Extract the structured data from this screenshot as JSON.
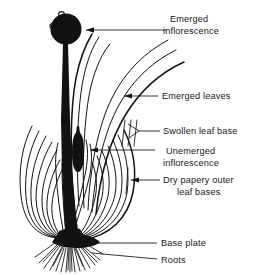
{
  "figure": {
    "background_color": "#ffffff",
    "ink_color": "#121212"
  },
  "labels": [
    {
      "id": "emerged-inflorescence",
      "line1": "Emerged",
      "line2": "inflorescence",
      "leader": "arrow",
      "points_to": "flower-head"
    },
    {
      "id": "emerged-leaves",
      "line1": "Emerged leaves",
      "line2": "",
      "leader": "arrow",
      "points_to": "outer-emerged-leaf"
    },
    {
      "id": "swollen-leaf-base",
      "line1": "Swollen leaf base",
      "line2": "",
      "leader": "fork",
      "points_to": "inner-fleshy-scales"
    },
    {
      "id": "unemerged-inflorescence",
      "line1": "Unemerged",
      "line2": "inflorescence",
      "leader": "arrow",
      "points_to": "inner-bud"
    },
    {
      "id": "dry-papery-outer-leaf-bases",
      "line1": "Dry papery outer",
      "line2": "leaf bases",
      "leader": "arrow",
      "points_to": "outer-tunic"
    },
    {
      "id": "base-plate",
      "line1": "Base plate",
      "line2": "",
      "leader": "line",
      "points_to": "basal-plate"
    },
    {
      "id": "roots",
      "line1": "Roots",
      "line2": "",
      "leader": "line",
      "points_to": "root-fan"
    }
  ],
  "parts": {
    "flower_head": {
      "name": "Emerged inflorescence",
      "floret_count": 9
    },
    "scape": {
      "name": "Flowering stem"
    },
    "emerged_leaves": {
      "name": "Emerged leaves",
      "count": 4
    },
    "bulb": {
      "name": "Bulb",
      "scale_layers": 9
    },
    "inner_bud": {
      "name": "Unemerged inflorescence",
      "segments": 6
    },
    "base_plate": {
      "name": "Base plate"
    },
    "roots": {
      "name": "Roots",
      "count": 21
    }
  }
}
